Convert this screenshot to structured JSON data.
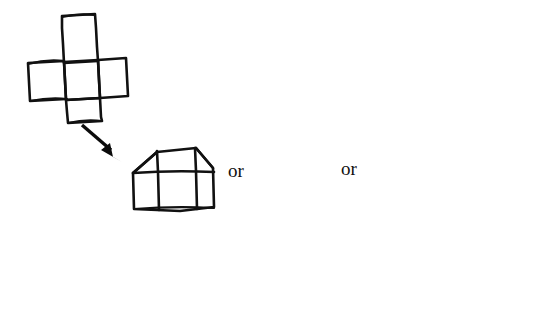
{
  "figure": {
    "background_color": "#ffffff",
    "ink_color": "#111111",
    "width": 550,
    "height": 314
  },
  "labels": {
    "or_1": "or",
    "or_2": "or"
  },
  "shapes": [
    {
      "id": "cube-net-cross",
      "name": "cube-net-cross",
      "description": "Unfolded cube net drawn as a hand-sketched cross of squares",
      "stage": 0,
      "square_count": 5,
      "bbox": [
        27,
        14,
        98,
        106
      ]
    },
    {
      "id": "folding-stage-1",
      "name": "partially-folded-net-wide",
      "description": "Net partly folded: wide house/hexagon outline with grid lines",
      "stage": 1,
      "bbox": [
        129,
        143,
        102,
        68
      ]
    },
    {
      "id": "folding-stage-2",
      "name": "partially-folded-net-medium",
      "description": "Net folded further: narrow cup shape with curved sides and one cross line",
      "stage": 2,
      "bbox": [
        263,
        140,
        72,
        70
      ]
    },
    {
      "id": "folding-stage-3",
      "name": "partially-folded-net-narrow",
      "description": "Net nearly closed: two panels with a curved right flap",
      "stage": 3,
      "bbox": [
        379,
        137,
        72,
        71
      ]
    },
    {
      "id": "finished-cube",
      "name": "finished-cube",
      "description": "Completed three dimensional cube drawn in perspective",
      "stage": 4,
      "bbox": [
        455,
        224,
        91,
        87
      ]
    }
  ],
  "arrows": [
    {
      "id": "arrow-net-to-stage1",
      "name": "arrow-net-to-stage1",
      "direction": "down-right",
      "from": "cube-net-cross",
      "to": "folding-stage-1"
    },
    {
      "id": "arrow-stage3-to-cube",
      "name": "arrow-stage3-to-cube",
      "direction": "down-right",
      "from": "folding-stage-3",
      "to": "finished-cube"
    }
  ]
}
